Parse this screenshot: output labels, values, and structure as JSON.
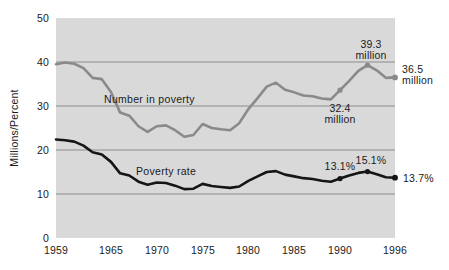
{
  "chart_data": {
    "type": "line",
    "title": "",
    "subtitle": "",
    "xlabel": "",
    "ylabel": "Millions/Percent",
    "xlim": [
      1959,
      1996
    ],
    "ylim": [
      0,
      50
    ],
    "grid": "horizontal",
    "legend_position": "inline-labels",
    "background": "#d9d9d9",
    "xticks": [
      "1959",
      "1965",
      "1970",
      "1975",
      "1980",
      "1985",
      "1990",
      "1996"
    ],
    "xtick_values": [
      1959,
      1965,
      1970,
      1975,
      1980,
      1985,
      1990,
      1996
    ],
    "yticks": [
      "0",
      "10",
      "20",
      "30",
      "40",
      "50"
    ],
    "ytick_values": [
      0,
      10,
      20,
      30,
      40,
      50
    ],
    "x": [
      1959,
      1960,
      1961,
      1962,
      1963,
      1964,
      1965,
      1966,
      1967,
      1968,
      1969,
      1970,
      1971,
      1972,
      1973,
      1974,
      1975,
      1976,
      1977,
      1978,
      1979,
      1980,
      1981,
      1982,
      1983,
      1984,
      1985,
      1986,
      1987,
      1988,
      1989,
      1990,
      1991,
      1992,
      1993,
      1994,
      1995,
      1996
    ],
    "series": [
      {
        "name": "Number in poverty",
        "units": "millions",
        "color": "#8a8a8a",
        "label_x": 1968.6,
        "label_y": 32.4,
        "values": [
          39.5,
          39.9,
          39.6,
          38.6,
          36.4,
          36.1,
          33.2,
          28.5,
          27.8,
          25.4,
          24.1,
          25.4,
          25.6,
          24.5,
          23.0,
          23.4,
          25.9,
          25.0,
          24.7,
          24.5,
          26.1,
          29.3,
          31.8,
          34.4,
          35.3,
          33.7,
          33.1,
          32.4,
          32.2,
          31.7,
          31.5,
          33.6,
          35.7,
          38.0,
          39.3,
          38.1,
          36.4,
          36.5
        ],
        "annotations": [
          {
            "text_line1": "39.3",
            "text_line2": "million",
            "x": 1993,
            "y": 39.3
          },
          {
            "text_line1": "36.5",
            "text_line2": "million",
            "x": 1996,
            "y": 36.5
          },
          {
            "text_line1": "32.4",
            "text_line2": "million",
            "x": 1990,
            "y": 32.4
          }
        ]
      },
      {
        "name": "Poverty rate",
        "units": "percent",
        "color": "#151515",
        "label_x": 1972.4,
        "label_y": 15.6,
        "values": [
          22.4,
          22.2,
          21.9,
          21.0,
          19.5,
          19.0,
          17.3,
          14.7,
          14.2,
          12.8,
          12.1,
          12.6,
          12.5,
          11.9,
          11.1,
          11.2,
          12.3,
          11.8,
          11.6,
          11.4,
          11.7,
          13.0,
          14.0,
          15.0,
          15.2,
          14.4,
          14.0,
          13.6,
          13.4,
          13.0,
          12.8,
          13.5,
          14.2,
          14.8,
          15.1,
          14.5,
          13.8,
          13.7
        ],
        "annotations": [
          {
            "text_line1": "13.1%",
            "text_line2": "",
            "x": 1990,
            "y": 13.5
          },
          {
            "text_line1": "15.1%",
            "text_line2": "",
            "x": 1993,
            "y": 15.1
          },
          {
            "text_line1": "13.7%",
            "text_line2": "",
            "x": 1996,
            "y": 13.7
          }
        ]
      }
    ]
  },
  "axes": {
    "y_title": "Millions/Percent",
    "y_labels": [
      "50",
      "40",
      "30",
      "20",
      "10",
      "0"
    ],
    "x_labels": [
      "1959",
      "1965",
      "1970",
      "1975",
      "1980",
      "1985",
      "1990",
      "1996"
    ]
  },
  "series_labels": {
    "number_in_poverty": "Number in poverty",
    "poverty_rate": "Poverty rate"
  },
  "annotations": {
    "peak_number_l1": "39.3",
    "peak_number_l2": "million",
    "end_number_l1": "36.5",
    "end_number_l2": "million",
    "mid_number_l1": "32.4",
    "mid_number_l2": "million",
    "rate_1990": "13.1%",
    "rate_1993": "15.1%",
    "rate_1996": "13.7%"
  },
  "colors": {
    "plot_background": "#d9d9d9",
    "gridline": "#8d8d8d",
    "number_series": "#8a8a8a",
    "rate_series": "#151515",
    "text": "#1b1b1b",
    "page_background": "#ffffff"
  }
}
